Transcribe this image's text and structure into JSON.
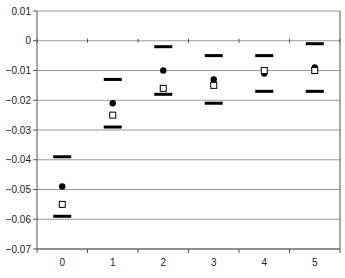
{
  "chart_data": {
    "type": "scatter",
    "title": "",
    "xlabel": "",
    "ylabel": "",
    "categories": [
      "0",
      "1",
      "2",
      "3",
      "4",
      "5"
    ],
    "x": [
      0,
      1,
      2,
      3,
      4,
      5
    ],
    "ylim": [
      -0.07,
      0.01
    ],
    "yticks": [
      "0.01",
      "0",
      "-0.01",
      "-0.02",
      "-0.03",
      "-0.04",
      "-0.05",
      "-0.06",
      "-0.07"
    ],
    "ytick_values": [
      0.01,
      0,
      -0.01,
      -0.02,
      -0.03,
      -0.04,
      -0.05,
      -0.06,
      -0.07
    ],
    "grid": true,
    "legend": null,
    "series": [
      {
        "name": "upper bound",
        "marker": "dash",
        "values": [
          -0.039,
          -0.013,
          -0.002,
          -0.005,
          -0.005,
          -0.001
        ]
      },
      {
        "name": "filled circle",
        "marker": "circle-filled",
        "values": [
          -0.049,
          -0.021,
          -0.01,
          -0.013,
          -0.011,
          -0.009
        ]
      },
      {
        "name": "open square",
        "marker": "square-open",
        "values": [
          -0.055,
          -0.025,
          -0.016,
          -0.015,
          -0.01,
          -0.01
        ]
      },
      {
        "name": "lower bound",
        "marker": "dash",
        "values": [
          -0.059,
          -0.029,
          -0.018,
          -0.021,
          -0.017,
          -0.017
        ]
      }
    ],
    "colors": {
      "marker": "#000000",
      "grid": "#9a9a9a",
      "axis": "#555555"
    }
  }
}
